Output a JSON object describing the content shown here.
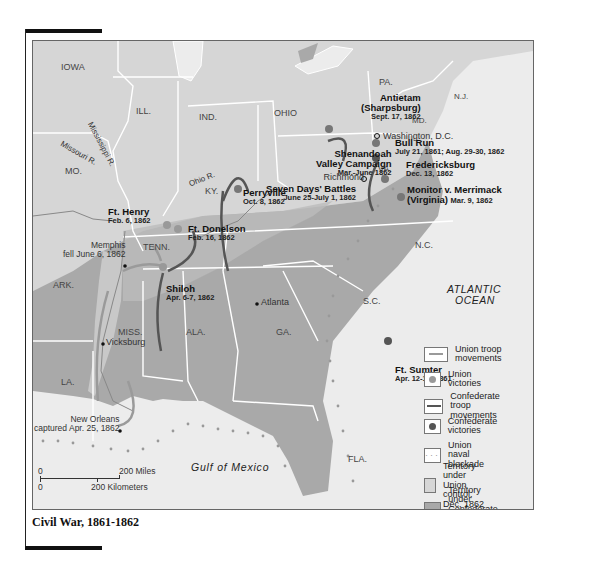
{
  "title": "Civil War, 1861-1862",
  "states": [
    {
      "id": "iowa",
      "label": "IOWA"
    },
    {
      "id": "ill",
      "label": "ILL."
    },
    {
      "id": "ind",
      "label": "IND."
    },
    {
      "id": "ohio",
      "label": "OHIO"
    },
    {
      "id": "pa",
      "label": "PA."
    },
    {
      "id": "nj",
      "label": "N.J."
    },
    {
      "id": "md",
      "label": "MD."
    },
    {
      "id": "mo",
      "label": "MO."
    },
    {
      "id": "ky",
      "label": "KY."
    },
    {
      "id": "va",
      "label": "VA."
    },
    {
      "id": "tenn",
      "label": "TENN."
    },
    {
      "id": "nc",
      "label": "N.C."
    },
    {
      "id": "ark",
      "label": "ARK."
    },
    {
      "id": "sc",
      "label": "S.C."
    },
    {
      "id": "miss",
      "label": "MISS."
    },
    {
      "id": "ala",
      "label": "ALA."
    },
    {
      "id": "ga",
      "label": "GA."
    },
    {
      "id": "la",
      "label": "LA."
    },
    {
      "id": "fla",
      "label": "FLA."
    }
  ],
  "rivers": {
    "mississippi": "Mississippi R.",
    "missouri": "Missouri R.",
    "ohio": "Ohio R."
  },
  "water": {
    "atlantic_1": "ATLANTIC",
    "atlantic_2": "OCEAN",
    "gulf": "Gulf of Mexico"
  },
  "cities": {
    "washington": "Washington, D.C.",
    "richmond": "Richmond",
    "atlanta": "Atlanta",
    "vicksburg": "Vicksburg",
    "memphis_1": "Memphis",
    "memphis_2": "fell June 6, 1862",
    "new_orleans_1": "New Orleans",
    "new_orleans_2": "captured Apr. 25, 1862"
  },
  "battles": {
    "antietam": {
      "name1": "Antietam",
      "name2": "(Sharpsburg)",
      "date": "Sept. 17, 1862"
    },
    "bull_run": {
      "name": "Bull Run",
      "date": "July 21, 1861; Aug. 29-30, 1862"
    },
    "shenandoah": {
      "name1": "Shenandoah",
      "name2": "Valley Campaign",
      "date": "Mar.-June 1862"
    },
    "fredericksburg": {
      "name": "Fredericksburg",
      "date": "Dec. 13, 1862"
    },
    "seven_days": {
      "name": "Seven Days' Battles",
      "date": "June 25-July 1, 1862"
    },
    "monitor": {
      "name1": "Monitor v. Merrimack",
      "name2": "(Virginia)",
      "date": "Mar. 9, 1862"
    },
    "perryville": {
      "name": "Perryville",
      "date": "Oct. 8, 1862"
    },
    "ft_henry": {
      "name": "Ft. Henry",
      "date": "Feb. 6, 1862"
    },
    "ft_donelson": {
      "name": "Ft. Donelson",
      "date": "Feb. 16, 1862"
    },
    "shiloh": {
      "name": "Shiloh",
      "date": "Apr. 6-7, 1862"
    },
    "ft_sumter": {
      "name": "Ft. Sumter",
      "date": "Apr. 12-13, 1861"
    }
  },
  "legend": {
    "items": [
      {
        "label1": "Union troop",
        "label2": "movements"
      },
      {
        "label1": "Union victories"
      },
      {
        "label1": "Confederate",
        "label2": "troop movements"
      },
      {
        "label1": "Confederate victories"
      },
      {
        "label1": "Union naval blockade"
      },
      {
        "label1": "Territory under",
        "label2": "Union control, Dec. 1862"
      },
      {
        "label1": "Territory under",
        "label2": "Confederate control,",
        "label3": "Dec. 1862"
      }
    ]
  },
  "scale": {
    "zero_top": "0",
    "miles": "200 Miles",
    "zero_bottom": "0",
    "km": "200 Kilometers"
  },
  "colors": {
    "union_territory": "#d6d6d6",
    "confederate_territory": "#a9a9a9",
    "water": "#ececec",
    "border": "#ffffff",
    "union_arrow": "#9a9a9a",
    "confederate_arrow": "#555555"
  }
}
